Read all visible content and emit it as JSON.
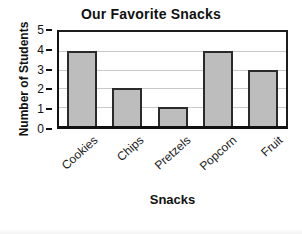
{
  "chart_data": {
    "type": "bar",
    "title": "Our Favorite Snacks",
    "xlabel": "Snacks",
    "ylabel": "Number of Students",
    "categories": [
      "Cookies",
      "Chips",
      "Pretzels",
      "Popcorn",
      "Fruit"
    ],
    "values": [
      4,
      2,
      1,
      4,
      3
    ],
    "ylim": [
      0,
      5
    ],
    "yticks": [
      0,
      1,
      2,
      3,
      4,
      5
    ],
    "grid": "horizontal",
    "legend": "none",
    "bar_color": "#bdbdbd",
    "bar_border_color": "#2a2a2a",
    "gridline_color": "#c9c9c9",
    "axis_color": "#111111",
    "text_color": "#111111",
    "background_color": "#ffffff"
  }
}
